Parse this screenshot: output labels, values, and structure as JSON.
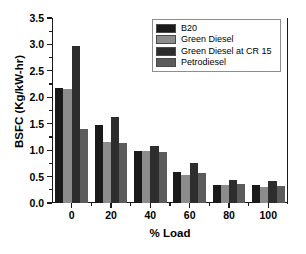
{
  "chart_data": {
    "type": "bar",
    "title": "",
    "xlabel": "% Load",
    "ylabel": "BSFC (Kg/kW-hr)",
    "categories": [
      "0",
      "20",
      "40",
      "60",
      "80",
      "100"
    ],
    "ylim": [
      0.0,
      3.5
    ],
    "yticks": [
      "0.0",
      "0.5",
      "1.0",
      "1.5",
      "2.0",
      "2.5",
      "3.0",
      "3.5"
    ],
    "grid": true,
    "legend_position": "top-right",
    "series": [
      {
        "name": "B20",
        "color": "#1a1a1a",
        "values": [
          2.17,
          1.47,
          0.99,
          0.58,
          0.34,
          0.34
        ]
      },
      {
        "name": "Green Diesel",
        "color": "#8c8c8c",
        "values": [
          2.15,
          1.16,
          0.99,
          0.53,
          0.34,
          0.31
        ]
      },
      {
        "name": "Green Diesel at CR 15",
        "color": "#2d2d2d",
        "values": [
          2.98,
          1.63,
          1.07,
          0.76,
          0.43,
          0.41
        ]
      },
      {
        "name": "Petrodiesel",
        "color": "#5c5c5c",
        "values": [
          1.4,
          1.14,
          0.97,
          0.56,
          0.36,
          0.32
        ]
      }
    ]
  },
  "axes": {
    "y_title": "BSFC (Kg/kW-hr)",
    "x_title": "% Load"
  }
}
